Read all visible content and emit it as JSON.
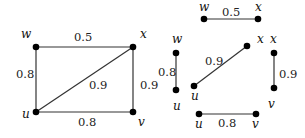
{
  "diagram": {
    "title": "",
    "graph": {
      "vertices": [
        "u",
        "v",
        "w",
        "x"
      ],
      "edges": [
        {
          "from": "w",
          "to": "x",
          "weight": "0.5"
        },
        {
          "from": "w",
          "to": "u",
          "weight": "0.8"
        },
        {
          "from": "u",
          "to": "x",
          "weight": "0.9"
        },
        {
          "from": "x",
          "to": "v",
          "weight": "0.9"
        },
        {
          "from": "u",
          "to": "v",
          "weight": "0.8"
        }
      ]
    },
    "main_graph": {
      "nodes": {
        "w": {
          "label": "w",
          "x": 36,
          "y": 47
        },
        "x": {
          "label": "x",
          "x": 133,
          "y": 47
        },
        "u": {
          "label": "u",
          "x": 36,
          "y": 112
        },
        "v": {
          "label": "v",
          "x": 133,
          "y": 112
        }
      },
      "weights": {
        "wx": "0.5",
        "wu": "0.8",
        "ux": "0.9",
        "xv": "0.9",
        "uv": "0.8"
      }
    },
    "decomposition": {
      "edge_wx": {
        "a": "w",
        "b": "x",
        "weight": "0.5"
      },
      "edge_wu": {
        "a": "w",
        "b": "u",
        "weight": "0.8"
      },
      "edge_ux": {
        "a": "u",
        "b": "x",
        "weight": "0.9"
      },
      "edge_xv": {
        "a": "x",
        "b": "v",
        "weight": "0.9"
      },
      "edge_uv": {
        "a": "u",
        "b": "v",
        "weight": "0.8"
      }
    }
  }
}
